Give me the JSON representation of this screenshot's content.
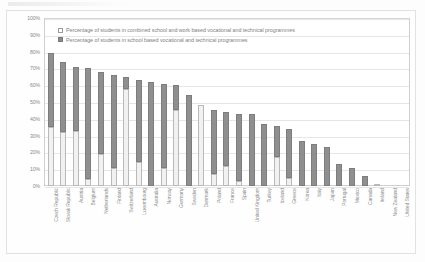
{
  "chart_data": {
    "type": "bar",
    "subtype": "stacked-column",
    "title": "",
    "xlabel": "",
    "ylabel": "",
    "ylim": [
      0,
      100
    ],
    "ytick_labels": [
      "100%",
      "90%",
      "80%",
      "70%",
      "60%",
      "50%",
      "40%",
      "30%",
      "20%",
      "10%",
      "0%"
    ],
    "ytick_values": [
      100,
      90,
      80,
      70,
      60,
      50,
      40,
      30,
      20,
      10,
      0
    ],
    "grid": true,
    "legend_position": "top-left-inside",
    "categories": [
      "Czech Republic",
      "Slovak Republic",
      "Austria",
      "Belgium",
      "Netherlands",
      "Finland",
      "Switzerland",
      "Luxembourg",
      "Australia",
      "Norway",
      "Germany",
      "Sweden",
      "Denmark",
      "Poland",
      "France",
      "Spain",
      "United Kingdom",
      "Turkey",
      "Iceland",
      "Greece",
      "Korea",
      "Italy",
      "Japan",
      "Portugal",
      "Mexico",
      "Canada",
      "Ireland",
      "New Zealand",
      "United States"
    ],
    "series": [
      {
        "name": "Percentage of students in combined school and work based vocational and technical programmes",
        "color": "#f1f1f1",
        "values": [
          35,
          32,
          33,
          4,
          19,
          11,
          58,
          14,
          0,
          11,
          45,
          0,
          48,
          7,
          12,
          3,
          0,
          0,
          17,
          5,
          0,
          0,
          0,
          0,
          0,
          0,
          1,
          0,
          0
        ]
      },
      {
        "name": "Percentage of students in school based vocational and technical programmes",
        "color": "#8f8f8f",
        "values": [
          44,
          42,
          38,
          66,
          49,
          55,
          7,
          49,
          62,
          50,
          15,
          54,
          0,
          38,
          32,
          40,
          43,
          37,
          19,
          29,
          27,
          25,
          23,
          13,
          11,
          6,
          0,
          0,
          0
        ]
      }
    ],
    "totals": [
      79,
      74,
      71,
      70,
      68,
      66,
      65,
      63,
      62,
      61,
      60,
      54,
      48,
      45,
      44,
      43,
      43,
      37,
      36,
      34,
      27,
      25,
      23,
      13,
      11,
      6,
      1,
      0,
      0
    ]
  },
  "legend": {
    "items": [
      {
        "marker": "light-square-marker",
        "label": "Percentage of students in combined school and work based vocational and technical programmes"
      },
      {
        "marker": "dark-square-marker",
        "label": "Percentage of students in school based vocational and technical programmes"
      }
    ]
  },
  "colors": {
    "series_light": "#f1f1f1",
    "series_dark": "#8f8f8f",
    "grid": "#e6e6e6",
    "axis_text": "#8a8a8a"
  }
}
